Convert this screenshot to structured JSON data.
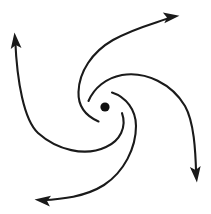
{
  "figure": {
    "background_color": "#ffffff",
    "stroke_color": "#1a1a1a",
    "stroke_width": 2.1,
    "width": 211,
    "height": 214
  },
  "center": {
    "label": "center-point",
    "x": 105,
    "y": 107,
    "radius": 4.6,
    "color": "#111111"
  },
  "arms": [
    {
      "id": "arm-up-right",
      "label": "upper-right arm",
      "direction": "right",
      "rotation": "counterclockwise",
      "start": {
        "x": 98,
        "y": 122
      },
      "end": {
        "x": 172,
        "y": 16
      },
      "arrowhead_angle_deg": -8,
      "path": "M 98.5 121.5 C 86 116 78 106 78.5 92 C 79 72 92 52 113 40 C 136 27 160 22 172.5 16.6"
    },
    {
      "id": "arm-right-down",
      "label": "right-down arm",
      "direction": "down",
      "rotation": "counterclockwise",
      "start": {
        "x": 88,
        "y": 101
      },
      "end": {
        "x": 196,
        "y": 176
      },
      "arrowhead_angle_deg": 84,
      "path": "M 88.5 101 C 94 88 106 78 122 75 C 146 71 172 84 185 106 C 194 122 195.5 150 196.2 175.5"
    },
    {
      "id": "arm-down-left",
      "label": "lower-left arm",
      "direction": "left",
      "rotation": "counterclockwise",
      "start": {
        "x": 112,
        "y": 92
      },
      "end": {
        "x": 41,
        "y": 200
      },
      "arrowhead_angle_deg": 186,
      "path": "M 112 92.5 C 126 97 136 110 136 126 C 136 148 124 172 104 185 C 85 197 62 199 41.5 200.3"
    },
    {
      "id": "arm-left-up",
      "label": "left-up arm",
      "direction": "up",
      "rotation": "counterclockwise",
      "start": {
        "x": 122,
        "y": 113
      },
      "end": {
        "x": 15,
        "y": 39
      },
      "arrowhead_angle_deg": -96,
      "path": "M 122 113.2 C 127 127 120 141 106 147 C 85 157 57 150 38 133 C 24 120 17 82 15.2 39.5"
    }
  ]
}
